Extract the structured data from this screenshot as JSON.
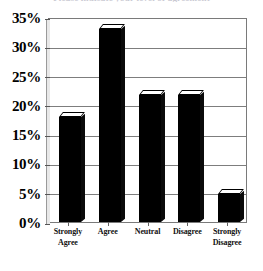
{
  "chart_data": {
    "type": "bar",
    "title": "",
    "xlabel": "",
    "ylabel": "",
    "categories": [
      "Strongly Agree",
      "Agree",
      "Neutral",
      "Disagree",
      "Strongly Disagree"
    ],
    "values": [
      18,
      33,
      21.7,
      21.7,
      4.8
    ],
    "ylim": [
      0,
      35
    ],
    "ytick_labels": [
      "0%",
      "5%",
      "10%",
      "15%",
      "20%",
      "25%",
      "30%",
      "35%"
    ],
    "ytick_values": [
      0,
      5,
      10,
      15,
      20,
      25,
      30,
      35
    ],
    "grid": true,
    "legend": false,
    "bar_color": "#000000",
    "style": "3d-black-bars"
  },
  "axes": {
    "y": {
      "ticks": [
        {
          "label": "35%",
          "value": 35
        },
        {
          "label": "30%",
          "value": 30
        },
        {
          "label": "25%",
          "value": 25
        },
        {
          "label": "20%",
          "value": 20
        },
        {
          "label": "15%",
          "value": 15
        },
        {
          "label": "10%",
          "value": 10
        },
        {
          "label": "5%",
          "value": 5
        },
        {
          "label": "0%",
          "value": 0
        }
      ]
    },
    "x": {
      "ticks": [
        {
          "line1": "Strongly",
          "line2": "Agree"
        },
        {
          "line1": "Agree",
          "line2": ""
        },
        {
          "line1": "Neutral",
          "line2": ""
        },
        {
          "line1": "Disagree",
          "line2": ""
        },
        {
          "line1": "Strongly",
          "line2": "Disagree"
        }
      ]
    }
  },
  "title": {
    "text": "Please indicate your level of agreement"
  }
}
